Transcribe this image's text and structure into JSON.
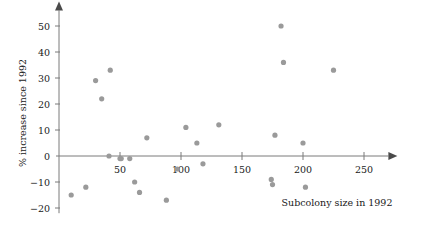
{
  "chart_data": {
    "type": "scatter",
    "title": "",
    "subtitle": "",
    "xlabel": "Subcolony size in 1992",
    "ylabel": "% increase since 1992",
    "xlim": [
      0,
      270
    ],
    "ylim": [
      -22,
      56
    ],
    "xticks": [
      50,
      100,
      150,
      200,
      250
    ],
    "yticks": [
      -20,
      -10,
      0,
      10,
      20,
      30,
      40,
      50
    ],
    "xtick_labels": [
      "50",
      "100",
      "150",
      "200",
      "250"
    ],
    "ytick_labels": [
      "-20",
      "-10",
      "0",
      "10",
      "20",
      "30",
      "40",
      "50"
    ],
    "grid": false,
    "legend": null,
    "legend_position": "none",
    "marker": "circle",
    "marker_color": "#9a9a9a",
    "axis_color": "#7a7a7a",
    "zero_line": true,
    "points": [
      {
        "x": 10,
        "y": -15
      },
      {
        "x": 22,
        "y": -12
      },
      {
        "x": 30,
        "y": 29
      },
      {
        "x": 35,
        "y": 22
      },
      {
        "x": 42,
        "y": 33
      },
      {
        "x": 41,
        "y": 0
      },
      {
        "x": 50,
        "y": -1
      },
      {
        "x": 51,
        "y": -1
      },
      {
        "x": 58,
        "y": -1
      },
      {
        "x": 62,
        "y": -10
      },
      {
        "x": 66,
        "y": -14
      },
      {
        "x": 72,
        "y": 7
      },
      {
        "x": 88,
        "y": -17
      },
      {
        "x": 97,
        "y": -5
      },
      {
        "x": 104,
        "y": 11
      },
      {
        "x": 113,
        "y": 5
      },
      {
        "x": 118,
        "y": -3
      },
      {
        "x": 131,
        "y": 12
      },
      {
        "x": 174,
        "y": -9
      },
      {
        "x": 175,
        "y": -11
      },
      {
        "x": 177,
        "y": 8
      },
      {
        "x": 182,
        "y": 50
      },
      {
        "x": 184,
        "y": 36
      },
      {
        "x": 200,
        "y": 5
      },
      {
        "x": 202,
        "y": -12
      },
      {
        "x": 225,
        "y": 33
      }
    ]
  },
  "axis": {
    "x_label_text": "Subcolony size in 1992",
    "y_label_text": "% increase since 1992"
  }
}
